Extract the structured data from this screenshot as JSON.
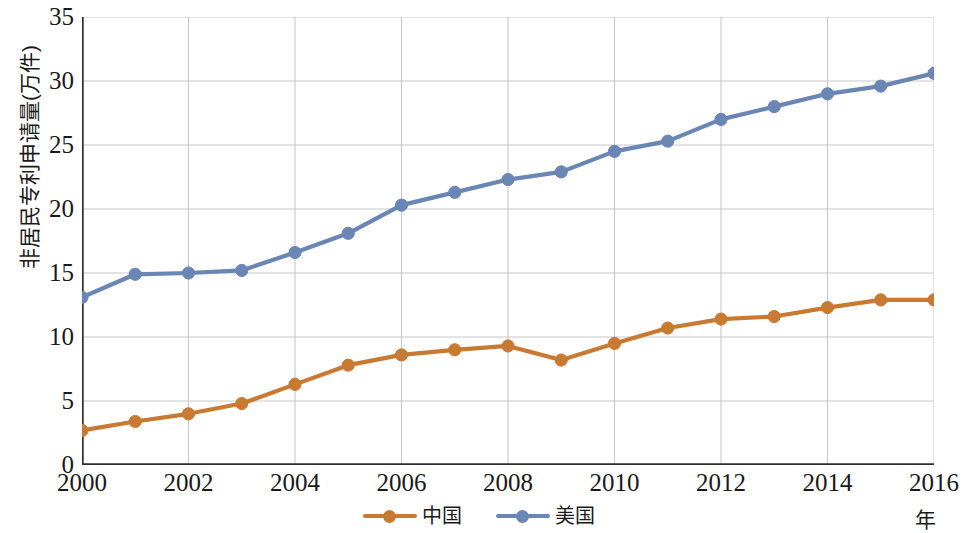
{
  "axes": {
    "y_title": "非居民专利申请量(万件)",
    "x_unit": "年",
    "y_ticks": [
      "0",
      "5",
      "10",
      "15",
      "20",
      "25",
      "30",
      "35"
    ],
    "x_ticks": [
      "2000",
      "2002",
      "2004",
      "2006",
      "2008",
      "2010",
      "2012",
      "2014",
      "2016"
    ]
  },
  "legend": {
    "items": [
      {
        "label": "中国",
        "color": "#c87a33"
      },
      {
        "label": "美国",
        "color": "#6a86b5"
      }
    ]
  },
  "colors": {
    "china": "#c87a33",
    "usa": "#6a86b5",
    "grid": "#c9c9c9",
    "axis": "#2e2e2e"
  },
  "chart_data": {
    "type": "line",
    "title": "",
    "xlabel": "年",
    "ylabel": "非居民专利申请量(万件)",
    "xlim": [
      2000,
      2016
    ],
    "ylim": [
      0,
      35
    ],
    "ytick_step": 5,
    "xtick_step": 2,
    "grid": true,
    "legend_position": "bottom-center",
    "x": [
      2000,
      2001,
      2002,
      2003,
      2004,
      2005,
      2006,
      2007,
      2008,
      2009,
      2010,
      2011,
      2012,
      2013,
      2014,
      2015,
      2016
    ],
    "series": [
      {
        "name": "中国",
        "color": "#c87a33",
        "values": [
          2.7,
          3.4,
          4.0,
          4.8,
          6.3,
          7.8,
          8.6,
          9.0,
          9.3,
          8.2,
          9.5,
          10.7,
          11.4,
          11.6,
          12.3,
          12.9,
          12.9
        ]
      },
      {
        "name": "美国",
        "color": "#6a86b5",
        "values": [
          13.1,
          14.9,
          15.0,
          15.2,
          16.6,
          18.1,
          20.3,
          21.3,
          22.3,
          22.9,
          24.5,
          25.3,
          27.0,
          28.0,
          29.0,
          29.6,
          30.6
        ]
      }
    ]
  }
}
